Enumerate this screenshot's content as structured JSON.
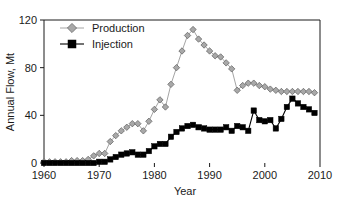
{
  "chart_data": {
    "type": "line",
    "title": "",
    "xlabel": "Year",
    "ylabel": "Annual Flow, Mt",
    "xlim": [
      1960,
      2010
    ],
    "ylim": [
      0,
      120
    ],
    "xticks": [
      1960,
      1970,
      1980,
      1990,
      2000,
      2010
    ],
    "yticks": [
      0,
      40,
      80,
      120
    ],
    "grid": false,
    "legend_position": "top-left",
    "colors": {
      "production": "#a8a8a8",
      "production_edge": "#5c5c5c",
      "injection": "#000000",
      "axis": "#1a1a1a",
      "background": "#ffffff"
    },
    "series": [
      {
        "name": "Production",
        "marker": "diamond",
        "x": [
          1960,
          1961,
          1962,
          1963,
          1964,
          1965,
          1966,
          1967,
          1968,
          1969,
          1970,
          1971,
          1972,
          1973,
          1974,
          1975,
          1976,
          1977,
          1978,
          1979,
          1980,
          1981,
          1982,
          1983,
          1984,
          1985,
          1986,
          1987,
          1988,
          1989,
          1990,
          1991,
          1992,
          1993,
          1994,
          1995,
          1996,
          1997,
          1998,
          1999,
          2000,
          2001,
          2002,
          2003,
          2004,
          2005,
          2006,
          2007,
          2008,
          2009
        ],
        "values": [
          1,
          1,
          1,
          1,
          1,
          2,
          2,
          2,
          3,
          6,
          8,
          8,
          18,
          23,
          27,
          30,
          33,
          33,
          27,
          35,
          45,
          53,
          47,
          66,
          80,
          94,
          107,
          112,
          104,
          99,
          94,
          90,
          89,
          84,
          79,
          61,
          65,
          67,
          67,
          65,
          64,
          62,
          61,
          60,
          60,
          60,
          60,
          60,
          60,
          59
        ]
      },
      {
        "name": "Injection",
        "marker": "square",
        "x": [
          1960,
          1961,
          1962,
          1963,
          1964,
          1965,
          1966,
          1967,
          1968,
          1969,
          1970,
          1971,
          1972,
          1973,
          1974,
          1975,
          1976,
          1977,
          1978,
          1979,
          1980,
          1981,
          1982,
          1983,
          1984,
          1985,
          1986,
          1987,
          1988,
          1989,
          1990,
          1991,
          1992,
          1993,
          1994,
          1995,
          1996,
          1997,
          1998,
          1999,
          2000,
          2001,
          2002,
          2003,
          2004,
          2005,
          2006,
          2007,
          2008,
          2009
        ],
        "values": [
          0,
          0,
          0,
          0,
          0,
          0,
          0,
          0,
          0,
          0,
          1,
          1,
          3,
          5,
          7,
          8,
          9,
          7,
          7,
          10,
          14,
          16,
          16,
          22,
          26,
          29,
          31,
          32,
          30,
          29,
          28,
          28,
          28,
          30,
          27,
          31,
          30,
          27,
          44,
          36,
          35,
          36,
          29,
          37,
          47,
          54,
          50,
          47,
          45,
          42
        ]
      }
    ]
  },
  "legend": {
    "entries": [
      {
        "label": "Production"
      },
      {
        "label": "Injection"
      }
    ]
  },
  "axes": {
    "y_title": "Annual Flow, Mt",
    "x_title": "Year",
    "y_tick_labels": [
      "0",
      "40",
      "80",
      "120"
    ],
    "x_tick_labels": [
      "1960",
      "1970",
      "1980",
      "1990",
      "2000",
      "2010"
    ]
  }
}
